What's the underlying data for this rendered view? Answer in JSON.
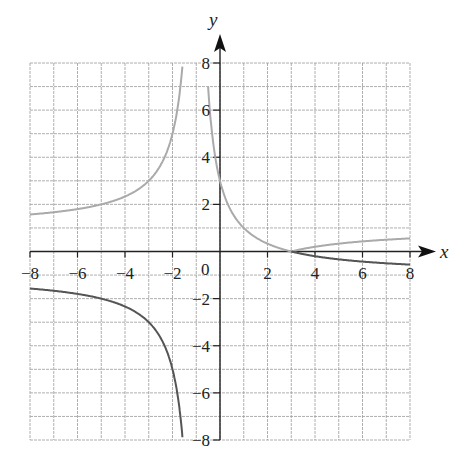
{
  "chart_data": {
    "type": "line",
    "title": "",
    "xlabel": "x",
    "ylabel": "y",
    "xlim": [
      -8,
      8
    ],
    "ylim": [
      -8,
      8
    ],
    "grid": true,
    "grid_step": 1,
    "x_ticks": [
      -8,
      -6,
      -4,
      -2,
      2,
      4,
      6,
      8
    ],
    "x_tick_labels": [
      "−8",
      "−6",
      "−4",
      "−2",
      "2",
      "4",
      "6",
      "8"
    ],
    "y_ticks": [
      8,
      6,
      4,
      2,
      -2,
      -4,
      -6,
      -8
    ],
    "y_tick_labels": [
      "8",
      "6",
      "4",
      "2",
      "−2",
      "−4",
      "−6",
      "−8"
    ],
    "origin_label": "0",
    "vertical_asymptote": -1,
    "series": [
      {
        "name": "f(x) = (3 - x)/(x + 1)",
        "color": "#555555",
        "style": "dark",
        "points": [
          {
            "x": -8,
            "y": -1.57
          },
          {
            "x": -6,
            "y": -1.8
          },
          {
            "x": -4,
            "y": -2.33
          },
          {
            "x": -3,
            "y": -3
          },
          {
            "x": -2,
            "y": -5
          },
          {
            "x": -1.5,
            "y": -9
          },
          {
            "x": 3,
            "y": 0
          },
          {
            "x": 4,
            "y": -0.2
          },
          {
            "x": 6,
            "y": -0.43
          },
          {
            "x": 8,
            "y": -0.56
          }
        ]
      },
      {
        "name": "|f(x)| = |(3 - x)/(x + 1)|",
        "color": "#aaaaaa",
        "style": "light",
        "points": [
          {
            "x": -8,
            "y": 1.57
          },
          {
            "x": -6,
            "y": 1.8
          },
          {
            "x": -4,
            "y": 2.33
          },
          {
            "x": -3,
            "y": 3
          },
          {
            "x": -2,
            "y": 5
          },
          {
            "x": -1.5,
            "y": 9
          },
          {
            "x": -0.5,
            "y": 7
          },
          {
            "x": 0,
            "y": 3
          },
          {
            "x": 1,
            "y": 1
          },
          {
            "x": 2,
            "y": 0.33
          },
          {
            "x": 3,
            "y": 0
          },
          {
            "x": 4,
            "y": 0.2
          },
          {
            "x": 6,
            "y": 0.43
          },
          {
            "x": 8,
            "y": 0.56
          }
        ]
      }
    ]
  }
}
